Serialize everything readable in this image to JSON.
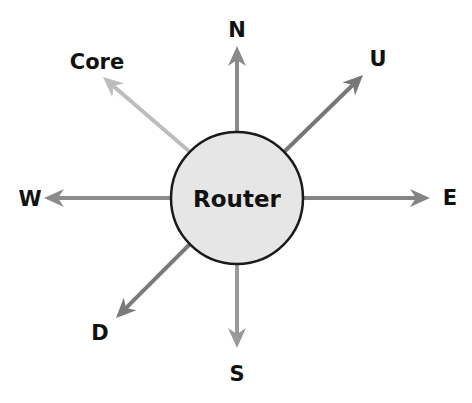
{
  "diagram": {
    "center": {
      "label": "Router",
      "cx": 237,
      "cy": 198,
      "r": 66,
      "fill": "#e6e6e6",
      "stroke": "#1a1a1a"
    },
    "arrows": [
      {
        "id": "north",
        "label": "N",
        "x1": 237,
        "y1": 132,
        "x2": 237,
        "y2": 46,
        "color": "#8a8a8a",
        "label_x": 237,
        "label_y": 30
      },
      {
        "id": "up",
        "label": "U",
        "x1": 284,
        "y1": 152,
        "x2": 363,
        "y2": 75,
        "color": "#777777",
        "label_x": 378,
        "label_y": 59
      },
      {
        "id": "east",
        "label": "E",
        "x1": 303,
        "y1": 198,
        "x2": 430,
        "y2": 198,
        "color": "#858585",
        "label_x": 450,
        "label_y": 198
      },
      {
        "id": "south",
        "label": "S",
        "x1": 237,
        "y1": 264,
        "x2": 237,
        "y2": 348,
        "color": "#9a9a9a",
        "label_x": 237,
        "label_y": 374
      },
      {
        "id": "down",
        "label": "D",
        "x1": 190,
        "y1": 244,
        "x2": 116,
        "y2": 318,
        "color": "#7a7a7a",
        "label_x": 100,
        "label_y": 333
      },
      {
        "id": "west",
        "label": "W",
        "x1": 171,
        "y1": 198,
        "x2": 44,
        "y2": 198,
        "color": "#8c8c8c",
        "label_x": 30,
        "label_y": 199
      },
      {
        "id": "core",
        "label": "Core",
        "x1": 190,
        "y1": 152,
        "x2": 103,
        "y2": 77,
        "color": "#bdbdbd",
        "label_x": 97,
        "label_y": 62
      }
    ]
  }
}
